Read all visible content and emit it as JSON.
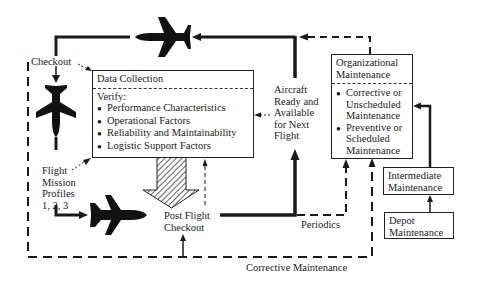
{
  "diagram": {
    "type": "maintenance-flow",
    "data_collection": {
      "title": "Data Collection",
      "verify_label": "Verify:",
      "items": [
        "Performance Characteristics",
        "Operational Factors",
        "Reliability and Maintainability",
        "Logistic Support Factors"
      ]
    },
    "organizational_maintenance": {
      "title_line1": "Organizational",
      "title_line2": "Maintenance",
      "items": [
        {
          "line1": "Corrective or",
          "line2": "Unscheduled",
          "line3": "Maintenance"
        },
        {
          "line1": "Preventive or",
          "line2": "Scheduled",
          "line3": "Maintenance"
        }
      ]
    },
    "intermediate_maintenance": {
      "line1": "Intermediate",
      "line2": "Maintenance"
    },
    "depot_maintenance": {
      "line1": "Depot",
      "line2": "Maintenance"
    },
    "labels": {
      "checkout": "Checkout",
      "flight_mission_profiles": [
        "Flight",
        "Mission",
        "Profiles",
        "1, 2, 3"
      ],
      "post_flight_checkout": [
        "Post Flight",
        "Checkout"
      ],
      "aircraft_ready": [
        "Aircraft",
        "Ready and",
        "Available",
        "for Next",
        "Flight"
      ],
      "periodics": "Periodics",
      "corrective_maintenance": "Corrective Maintenance"
    },
    "icons": {
      "aircraft_top": "airplane-left",
      "aircraft_left": "airplane-down",
      "aircraft_bottom": "airplane-right",
      "flow_arrow": "hatched-down-arrow"
    },
    "colors": {
      "ink": "#1a1a1a",
      "background": "#ffffff"
    }
  }
}
